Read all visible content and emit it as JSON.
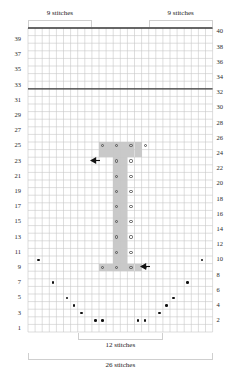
{
  "chart_data": {
    "type": "table",
    "xlabel": "26 stitches",
    "ylabel": "",
    "columns": 26,
    "rows": 40,
    "grid": true,
    "row_labels_left": [
      39,
      37,
      35,
      33,
      31,
      29,
      27,
      25,
      23,
      21,
      19,
      17,
      15,
      13,
      11,
      9,
      7,
      5,
      3,
      1
    ],
    "row_labels_right": [
      40,
      38,
      36,
      34,
      32,
      30,
      28,
      26,
      24,
      22,
      20,
      18,
      16,
      14,
      12,
      10,
      8,
      6,
      4,
      2
    ],
    "top_brackets": [
      {
        "label": "9 stitches",
        "start_col": 1,
        "end_col": 9
      },
      {
        "label": "9 stitches",
        "start_col": 18,
        "end_col": 26
      }
    ],
    "bottom_brackets": [
      {
        "label": "12 stitches",
        "start_col": 8,
        "end_col": 19
      }
    ],
    "bottom_caption": "26 stitches",
    "heavy_rows": [
      32,
      40
    ],
    "shaded_cells": [
      {
        "row": 25,
        "cols": [
          11,
          12,
          13,
          14,
          15,
          16
        ]
      },
      {
        "row": 24,
        "cols": [
          11,
          12,
          13,
          14,
          15,
          16
        ]
      },
      {
        "row": 23,
        "cols": [
          13,
          14
        ]
      },
      {
        "row": 22,
        "cols": [
          13,
          14
        ]
      },
      {
        "row": 21,
        "cols": [
          13,
          14
        ]
      },
      {
        "row": 20,
        "cols": [
          13,
          14
        ]
      },
      {
        "row": 19,
        "cols": [
          13,
          14
        ]
      },
      {
        "row": 18,
        "cols": [
          13,
          14
        ]
      },
      {
        "row": 17,
        "cols": [
          13,
          14
        ]
      },
      {
        "row": 16,
        "cols": [
          13,
          14
        ]
      },
      {
        "row": 15,
        "cols": [
          13,
          14
        ]
      },
      {
        "row": 14,
        "cols": [
          13,
          14
        ]
      },
      {
        "row": 13,
        "cols": [
          13,
          14
        ]
      },
      {
        "row": 12,
        "cols": [
          13,
          14
        ]
      },
      {
        "row": 11,
        "cols": [
          13,
          14
        ]
      },
      {
        "row": 10,
        "cols": [
          13,
          14
        ]
      },
      {
        "row": 9,
        "cols": [
          11,
          12,
          13,
          14,
          15,
          16
        ]
      }
    ],
    "circle_markers": [
      {
        "row": 25,
        "col": 11
      },
      {
        "row": 25,
        "col": 13
      },
      {
        "row": 25,
        "col": 15
      },
      {
        "row": 25,
        "col": 17
      },
      {
        "row": 23,
        "col": 13
      },
      {
        "row": 23,
        "col": 15
      },
      {
        "row": 21,
        "col": 13
      },
      {
        "row": 21,
        "col": 15
      },
      {
        "row": 19,
        "col": 13
      },
      {
        "row": 19,
        "col": 15
      },
      {
        "row": 17,
        "col": 13
      },
      {
        "row": 17,
        "col": 15
      },
      {
        "row": 15,
        "col": 13
      },
      {
        "row": 15,
        "col": 15
      },
      {
        "row": 13,
        "col": 13
      },
      {
        "row": 13,
        "col": 15
      },
      {
        "row": 11,
        "col": 13
      },
      {
        "row": 11,
        "col": 15
      },
      {
        "row": 9,
        "col": 11
      },
      {
        "row": 9,
        "col": 13
      },
      {
        "row": 9,
        "col": 15
      },
      {
        "row": 9,
        "col": 17
      }
    ],
    "dot_markers": [
      {
        "row": 10,
        "col": 2
      },
      {
        "row": 10,
        "col": 25
      },
      {
        "row": 7,
        "col": 4
      },
      {
        "row": 7,
        "col": 23
      },
      {
        "row": 5,
        "col": 6
      },
      {
        "row": 5,
        "col": 21
      },
      {
        "row": 4,
        "col": 7
      },
      {
        "row": 4,
        "col": 20
      },
      {
        "row": 3,
        "col": 8
      },
      {
        "row": 3,
        "col": 19
      },
      {
        "row": 2,
        "col": 10
      },
      {
        "row": 2,
        "col": 11
      },
      {
        "row": 2,
        "col": 16
      },
      {
        "row": 2,
        "col": 17
      }
    ],
    "arrows": [
      {
        "row": 24,
        "col": 10,
        "direction": "left"
      },
      {
        "row": 10,
        "col": 17,
        "direction": "left"
      }
    ],
    "colors": {
      "grid_line": "#c8c8c8",
      "heavy_line": "#3a3a3a",
      "shade": "#c9c9c9",
      "marker": "#111111",
      "bracket": "#cfcfcf",
      "text": "#1a1a1a"
    }
  }
}
